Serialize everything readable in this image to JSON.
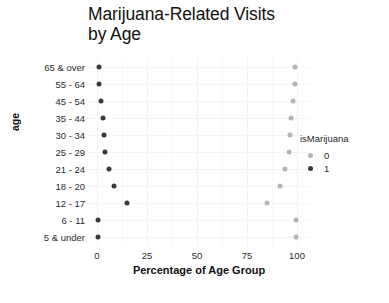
{
  "chart_data": {
    "type": "scatter",
    "title": "Marijuana-Related Visits by Age",
    "title_line1": "Marijuana-Related Visits",
    "title_line2": "by Age",
    "xlabel": "Percentage of Age Group",
    "ylabel": "age",
    "xlim": [
      -4,
      106
    ],
    "xticks": [
      0,
      25,
      50,
      75,
      100
    ],
    "xticklabels": [
      "0",
      "25",
      "50",
      "75",
      "100"
    ],
    "categories": [
      "65 & over",
      "55 - 64",
      "45 - 54",
      "35 - 44",
      "30 - 34",
      "25 - 29",
      "21 - 24",
      "18 - 20",
      "12 - 17",
      "6 - 11",
      "5 & under"
    ],
    "grid": true,
    "legend": {
      "title": "isMarijuana",
      "position": "right",
      "entries": [
        {
          "label": "0",
          "color": "#b4b4b4"
        },
        {
          "label": "1",
          "color": "#3a3a3a"
        }
      ]
    },
    "series": [
      {
        "name": "1",
        "legend_value": "1",
        "color": "#3a3a3a",
        "values": [
          0.8,
          1.2,
          1.8,
          3.2,
          3.4,
          4.2,
          6.2,
          8.6,
          14.8,
          0.6,
          0.5
        ]
      },
      {
        "name": "0",
        "legend_value": "0",
        "color": "#b4b4b4",
        "values": [
          99.2,
          98.8,
          98.2,
          96.8,
          96.6,
          95.8,
          93.8,
          91.4,
          85.2,
          99.4,
          99.5
        ]
      }
    ]
  }
}
